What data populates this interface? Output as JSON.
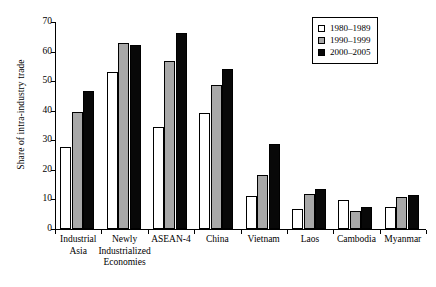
{
  "chart_data": {
    "type": "bar",
    "title": "",
    "xlabel": "",
    "ylabel": "Share of intra-industry trade",
    "ylim": [
      0,
      70
    ],
    "yticks": [
      0,
      10,
      20,
      30,
      40,
      50,
      60,
      70
    ],
    "grid": false,
    "legend_position": "top-right",
    "categories": [
      "Industrial\nAsia",
      "Newly\nIndustrialized\nEconomies",
      "ASEAN-4",
      "China",
      "Vietnam",
      "Laos",
      "Cambodia",
      "Myanmar"
    ],
    "series": [
      {
        "name": "1980–1989",
        "color": "#ffffff",
        "values": [
          27.7,
          53.0,
          34.4,
          39.2,
          11.0,
          6.9,
          9.8,
          7.3
        ]
      },
      {
        "name": "1990–1999",
        "color": "#a8a8a8",
        "values": [
          39.6,
          62.8,
          56.9,
          48.7,
          18.2,
          11.9,
          6.0,
          10.8
        ]
      },
      {
        "name": "2000–2005",
        "color": "#080808",
        "values": [
          46.7,
          62.3,
          66.3,
          54.0,
          28.9,
          13.7,
          7.5,
          11.5
        ]
      }
    ]
  },
  "axis": {
    "y_title": "Share of intra-industry trade"
  }
}
